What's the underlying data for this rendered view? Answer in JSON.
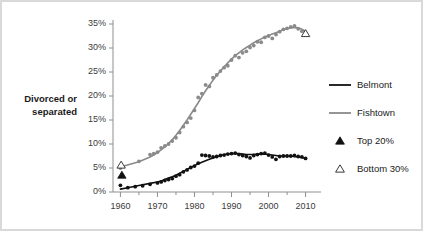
{
  "chart_data": {
    "type": "scatter",
    "title": "",
    "subtitle": "",
    "ylabel_line1": "Divorced or",
    "ylabel_line2": "separated",
    "xlabel": "",
    "xlim": [
      1958,
      2012
    ],
    "ylim": [
      0,
      35
    ],
    "grid": false,
    "legend_position": "right",
    "ytick_labels": [
      "0%",
      "5%",
      "10%",
      "15%",
      "20%",
      "25%",
      "30%",
      "35%"
    ],
    "ytick_values": [
      0,
      5,
      10,
      15,
      20,
      25,
      30,
      35
    ],
    "xtick_labels": [
      "1960",
      "1970",
      "1980",
      "1990",
      "2000",
      "2010"
    ],
    "xtick_values": [
      1960,
      1970,
      1980,
      1990,
      2000,
      2010
    ],
    "xminor_tick_values": [
      1965,
      1975,
      1985,
      1995,
      2005
    ],
    "series": [
      {
        "name": "Belmont",
        "type": "scatter-with-trend",
        "color": "#111111",
        "x": [
          1960,
          1962,
          1964,
          1966,
          1968,
          1970,
          1971,
          1972,
          1973,
          1974,
          1975,
          1976,
          1977,
          1978,
          1979,
          1980,
          1981,
          1982,
          1983,
          1984,
          1985,
          1986,
          1987,
          1988,
          1989,
          1990,
          1991,
          1992,
          1993,
          1994,
          1995,
          1996,
          1997,
          1998,
          1999,
          2000,
          2001,
          2002,
          2003,
          2004,
          2005,
          2006,
          2007,
          2008,
          2009,
          2010
        ],
        "values": [
          1.4,
          0.9,
          1.1,
          1.3,
          1.6,
          1.9,
          2.1,
          2.4,
          2.6,
          2.8,
          3.3,
          3.6,
          4.2,
          4.6,
          5.1,
          5.4,
          6.0,
          7.7,
          7.6,
          7.5,
          7.3,
          7.4,
          7.6,
          7.7,
          7.9,
          8.0,
          8.1,
          7.8,
          7.6,
          7.4,
          7.1,
          7.6,
          7.8,
          8.0,
          8.1,
          7.7,
          7.3,
          6.8,
          7.4,
          7.5,
          7.5,
          7.5,
          7.6,
          7.4,
          7.3,
          7.0
        ],
        "trend": [
          0.6,
          0.9,
          1.2,
          1.5,
          1.8,
          2.1,
          2.3,
          2.6,
          2.9,
          3.2,
          3.5,
          3.9,
          4.3,
          4.7,
          5.1,
          5.5,
          5.9,
          6.2,
          6.5,
          6.8,
          7.1,
          7.4,
          7.6,
          7.8,
          7.9,
          8.0,
          8.0,
          8.0,
          7.9,
          7.8,
          7.8,
          7.8,
          7.9,
          7.9,
          7.9,
          7.8,
          7.7,
          7.6,
          7.5,
          7.5,
          7.5,
          7.5,
          7.4,
          7.3,
          7.2,
          7.0
        ]
      },
      {
        "name": "Fishtown",
        "type": "scatter-with-trend",
        "color": "#8a8a8a",
        "x": [
          1960,
          1965,
          1968,
          1969,
          1970,
          1971,
          1972,
          1973,
          1974,
          1975,
          1976,
          1977,
          1978,
          1979,
          1980,
          1981,
          1982,
          1983,
          1984,
          1985,
          1986,
          1987,
          1988,
          1989,
          1990,
          1991,
          1992,
          1993,
          1994,
          1995,
          1996,
          1997,
          1998,
          1999,
          2000,
          2001,
          2002,
          2003,
          2004,
          2005,
          2006,
          2007,
          2008,
          2009,
          2010
        ],
        "values": [
          5.0,
          6.4,
          7.8,
          8.0,
          8.3,
          9.2,
          9.6,
          10.0,
          10.6,
          11.3,
          12.4,
          13.6,
          14.5,
          15.4,
          17.0,
          19.7,
          20.5,
          22.3,
          22.0,
          23.8,
          24.4,
          25.2,
          25.9,
          26.3,
          27.5,
          28.4,
          28.0,
          29.0,
          29.3,
          30.1,
          30.5,
          31.3,
          31.2,
          32.2,
          32.5,
          32.0,
          32.8,
          33.4,
          33.9,
          34.1,
          34.4,
          34.6,
          34.0,
          33.5,
          33.2
        ],
        "trend": [
          5.2,
          6.3,
          7.3,
          7.7,
          8.2,
          8.8,
          9.4,
          10.1,
          10.9,
          11.8,
          12.8,
          13.9,
          15.0,
          16.2,
          17.4,
          18.6,
          19.9,
          21.1,
          22.2,
          23.3,
          24.3,
          25.2,
          26.1,
          26.9,
          27.7,
          28.4,
          29.0,
          29.6,
          30.1,
          30.6,
          31.1,
          31.5,
          31.9,
          32.3,
          32.6,
          32.9,
          33.2,
          33.5,
          33.8,
          34.0,
          34.2,
          34.3,
          34.2,
          33.9,
          33.5
        ]
      }
    ],
    "markers": [
      {
        "name": "Top 20%",
        "symbol": "filled-triangle",
        "color": "#111111",
        "x": 1960.4,
        "y": 3.5
      },
      {
        "name": "Bottom 30%",
        "symbol": "open-triangle",
        "color": "#ffffff",
        "x": 1960.2,
        "y": 5.6
      },
      {
        "name": "Bottom 30%",
        "symbol": "open-triangle",
        "color": "#ffffff",
        "x": 2010.0,
        "y": 33.0
      }
    ],
    "legend": [
      {
        "label": "Belmont",
        "marker": "line",
        "color": "#111111"
      },
      {
        "label": "Fishtown",
        "marker": "line",
        "color": "#8a8a8a"
      },
      {
        "label": "Top 20%",
        "marker": "filled-triangle",
        "color": "#111111"
      },
      {
        "label": "Bottom 30%",
        "marker": "open-triangle",
        "color": "#ffffff"
      }
    ]
  },
  "colors": {
    "belmont": "#111111",
    "fishtown": "#8a8a8a",
    "axis": "#8c8f93",
    "text": "#1a1a1a",
    "frame": "#d7d9db",
    "background": "#ffffff"
  }
}
